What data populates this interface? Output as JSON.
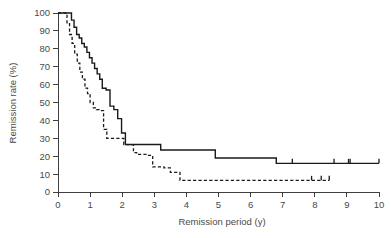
{
  "chart_data": {
    "type": "line",
    "title": "",
    "xlabel": "Remission period (y)",
    "ylabel": "Remission rate (%)",
    "xlim": [
      0,
      10
    ],
    "ylim": [
      0,
      100
    ],
    "xticks": [
      "0",
      "1",
      "2",
      "3",
      "4",
      "5",
      "6",
      "7",
      "8",
      "9",
      "10"
    ],
    "yticks": [
      "0",
      "10",
      "20",
      "30",
      "40",
      "50",
      "60",
      "70",
      "80",
      "90",
      "100"
    ],
    "grid": false,
    "legend_position": "none",
    "series": [
      {
        "name": "solid-curve",
        "style": "solid",
        "color": "#1a1a1a",
        "x": [
          0,
          0.35,
          0.42,
          0.5,
          0.58,
          0.66,
          0.74,
          0.82,
          0.9,
          0.98,
          1.06,
          1.14,
          1.22,
          1.3,
          1.38,
          1.5,
          1.62,
          1.74,
          1.86,
          1.98,
          2.1,
          3.2,
          4.9,
          6.8,
          10
        ],
        "y": [
          100,
          100,
          96,
          92,
          88,
          86,
          83,
          81,
          78,
          75,
          72,
          69,
          66,
          63,
          58,
          57,
          48,
          46,
          41,
          33,
          26.5,
          23.5,
          19,
          16,
          16
        ],
        "censored_x": [
          7.3,
          8.6,
          9.05,
          9.1,
          10
        ],
        "censored_y": [
          16,
          16,
          16,
          16,
          16
        ]
      },
      {
        "name": "dashed-curve",
        "style": "dashed",
        "color": "#1a1a1a",
        "x": [
          0,
          0.2,
          0.28,
          0.36,
          0.44,
          0.52,
          0.6,
          0.68,
          0.76,
          0.84,
          0.92,
          1.0,
          1.1,
          1.2,
          1.3,
          1.42,
          1.52,
          2.05,
          2.2,
          2.35,
          2.45,
          2.8,
          2.95,
          3.3,
          3.5,
          3.8,
          8.45
        ],
        "y": [
          100,
          100,
          94,
          88,
          83,
          77,
          72,
          67,
          63,
          58,
          55,
          50,
          47,
          46,
          45.5,
          35,
          30,
          26.5,
          26.5,
          22,
          21,
          20.5,
          14,
          13.5,
          11,
          6.5,
          6.5
        ],
        "censored_x": [
          7.9,
          8.2,
          8.45
        ],
        "censored_y": [
          6.5,
          6.5,
          6.5
        ]
      }
    ]
  },
  "axes": {
    "x_title": "Remission period (y)",
    "y_title": "Remission rate (%)"
  }
}
